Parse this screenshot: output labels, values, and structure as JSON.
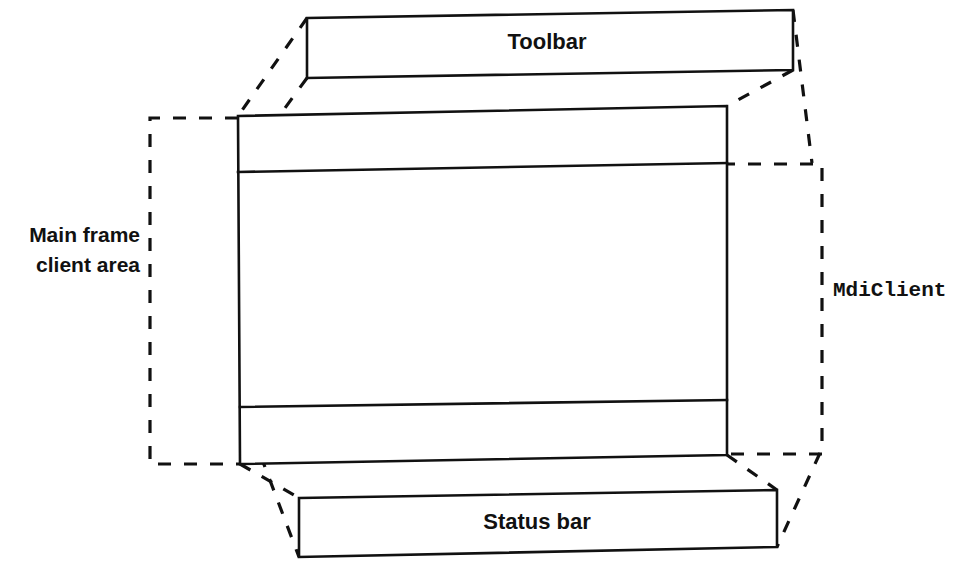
{
  "diagram": {
    "background_color": "#ffffff",
    "line_color": "#111111",
    "boxes": {
      "toolbar": {
        "label": "Toolbar",
        "style": "solid",
        "points": "307,18 793,10 793,70 307,78"
      },
      "status_bar": {
        "label": "Status bar",
        "style": "solid",
        "points": "299,498 777,490 777,547 299,557"
      },
      "main_frame": {
        "style": "solid",
        "outline": "238,116 727,106 727,455 240,464",
        "divider_top": "238,172 727,163",
        "divider_bottom": "240,407 727,400"
      }
    },
    "annotations": {
      "main_frame_client_area": {
        "line1": "Main frame",
        "line2": "client area",
        "style": "dashed",
        "font": "sans-bold",
        "rect": "150,118 238,118 238,464 150,464"
      },
      "mdi_client": {
        "label": "MdiClient",
        "style": "dashed",
        "font": "mono-bold",
        "rect": "722,163 822,163 822,455 727,455"
      }
    },
    "connectors": [
      {
        "name": "toolbar-left-outer",
        "from": "307,18",
        "to": "238,116"
      },
      {
        "name": "toolbar-left-inner",
        "from": "307,78",
        "to": "238,172"
      },
      {
        "name": "toolbar-right-inner",
        "from": "793,70",
        "to": "727,106"
      },
      {
        "name": "toolbar-right-outer",
        "from": "793,10",
        "to": "812,163"
      },
      {
        "name": "statusbar-left-inner",
        "from": "240,464",
        "to": "299,498"
      },
      {
        "name": "statusbar-left-outer",
        "from": "240,407",
        "to": "299,557"
      },
      {
        "name": "statusbar-right-inner",
        "from": "727,455",
        "to": "777,490"
      },
      {
        "name": "statusbar-right-outer",
        "from": "820,453",
        "to": "777,547"
      }
    ]
  }
}
